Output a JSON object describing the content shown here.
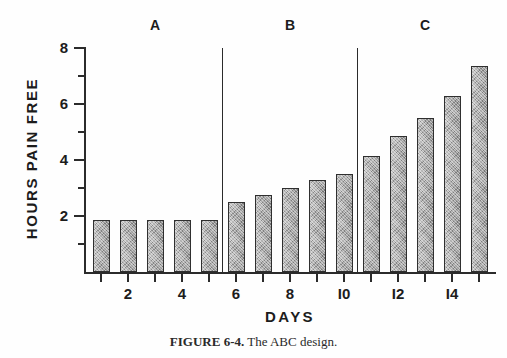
{
  "figure": {
    "caption_label": "FIGURE 6-4.",
    "caption_text": "The ABC design."
  },
  "chart_data": {
    "type": "bar",
    "title": "",
    "xlabel": "DAYS",
    "ylabel": "HOURS PAIN FREE",
    "xlim": [
      0,
      16
    ],
    "ylim": [
      0,
      8
    ],
    "grid": false,
    "legend": "none",
    "x": [
      1,
      2,
      3,
      4,
      5,
      6,
      7,
      8,
      9,
      10,
      11,
      12,
      13,
      14,
      15
    ],
    "categories": [
      "1",
      "2",
      "3",
      "4",
      "5",
      "6",
      "7",
      "8",
      "9",
      "10",
      "11",
      "12",
      "13",
      "14",
      "15"
    ],
    "values": [
      1.85,
      1.85,
      1.85,
      1.85,
      1.85,
      2.5,
      2.75,
      3.0,
      3.3,
      3.5,
      4.15,
      4.85,
      5.5,
      6.3,
      7.35
    ],
    "y_tick_labels": [
      "2",
      "4",
      "6",
      "8"
    ],
    "y_tick_values": [
      2,
      4,
      6,
      8
    ],
    "y_minor_tick_values": [
      1,
      3,
      5,
      7
    ],
    "x_tick_labels": [
      "2",
      "4",
      "6",
      "8",
      "I0",
      "I2",
      "I4"
    ],
    "x_tick_values": [
      2,
      4,
      6,
      8,
      10,
      12,
      14
    ],
    "phases": [
      {
        "label": "A",
        "start_day": 1,
        "end_day": 5,
        "center_day": 3
      },
      {
        "label": "B",
        "start_day": 6,
        "end_day": 10,
        "center_day": 8
      },
      {
        "label": "C",
        "start_day": 11,
        "end_day": 15,
        "center_day": 13
      }
    ],
    "phase_divider_positions": [
      5.5,
      10.5
    ],
    "bar_fill_color": "#a3a3a3",
    "bar_outline_color": "#2f2f2f",
    "axis_color": "#2b2b2b"
  }
}
